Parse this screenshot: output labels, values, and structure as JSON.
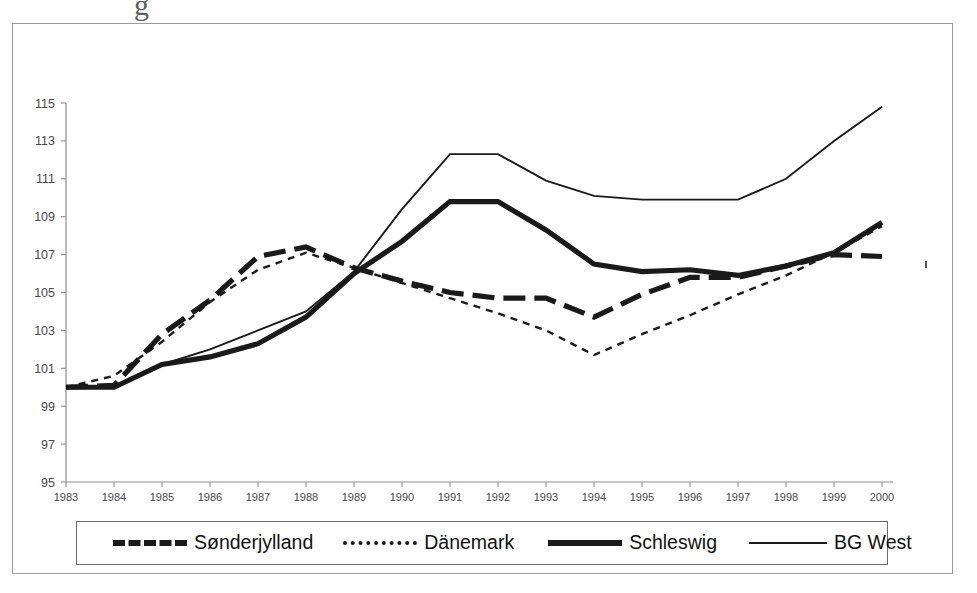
{
  "artifact_text": "g",
  "chart_data": {
    "type": "line",
    "title": "",
    "subtitle": "",
    "xlabel": "",
    "ylabel": "",
    "x": [
      1983,
      1984,
      1985,
      1986,
      1987,
      1988,
      1989,
      1990,
      1991,
      1992,
      1993,
      1994,
      1995,
      1996,
      1997,
      1998,
      1999,
      2000
    ],
    "categories": [
      "1983",
      "1984",
      "1985",
      "1986",
      "1987",
      "1988",
      "1989",
      "1990",
      "1991",
      "1992",
      "1993",
      "1994",
      "1995",
      "1996",
      "1997",
      "1998",
      "1999",
      "2000"
    ],
    "xlim": [
      1983,
      2000
    ],
    "ylim": [
      95,
      115
    ],
    "yticks": [
      95,
      97,
      99,
      101,
      103,
      105,
      107,
      109,
      111,
      113,
      115
    ],
    "ytick_labels": [
      "95",
      "97",
      "99",
      "101",
      "103",
      "105",
      "107",
      "109",
      "111",
      "113",
      "115"
    ],
    "grid": false,
    "legend_position": "bottom",
    "series": [
      {
        "name": "Sønderjylland",
        "style": "thick-dashed",
        "color": "#1a1a1a",
        "values": [
          100.0,
          100.1,
          102.8,
          104.6,
          106.9,
          107.4,
          106.3,
          105.6,
          105.0,
          104.7,
          104.7,
          103.7,
          104.9,
          105.8,
          105.8,
          106.4,
          107.0,
          106.9
        ]
      },
      {
        "name": "Dänemark",
        "style": "dotted",
        "color": "#1a1a1a",
        "values": [
          100.0,
          100.6,
          102.4,
          104.5,
          106.2,
          107.1,
          106.3,
          105.5,
          104.7,
          103.9,
          103.0,
          101.7,
          102.8,
          103.8,
          104.9,
          105.9,
          107.1,
          108.5
        ]
      },
      {
        "name": "Schleswig",
        "style": "thick-solid",
        "color": "#1a1a1a",
        "values": [
          100.0,
          100.0,
          101.2,
          101.6,
          102.3,
          103.7,
          106.0,
          107.7,
          109.8,
          109.8,
          108.3,
          106.5,
          106.1,
          106.2,
          105.9,
          106.4,
          107.1,
          108.7
        ]
      },
      {
        "name": "BG West",
        "style": "thin-solid",
        "color": "#1a1a1a",
        "values": [
          100.0,
          100.0,
          101.2,
          102.0,
          103.0,
          104.0,
          106.1,
          109.4,
          112.3,
          112.3,
          110.9,
          110.1,
          109.9,
          109.9,
          109.9,
          111.0,
          113.0,
          114.8
        ]
      }
    ],
    "legend": [
      {
        "label": "Sønderjylland",
        "style": "thick-dashed"
      },
      {
        "label": "Dänemark",
        "style": "dotted"
      },
      {
        "label": "Schleswig",
        "style": "thick-solid"
      },
      {
        "label": "BG West",
        "style": "thin-solid"
      }
    ]
  }
}
